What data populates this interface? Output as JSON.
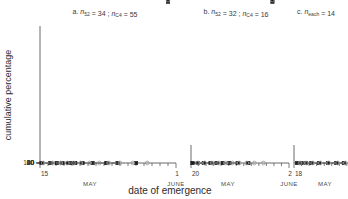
{
  "figure": {
    "ylabel": "cumulative percentage",
    "xlabel": "date of emergence"
  },
  "chart_data": {
    "type": "line",
    "title": "",
    "xlabel": "date of emergence",
    "ylabel": "cumulative percentage",
    "yscale": "probit",
    "ylim": [
      10,
      100
    ],
    "yticks": [
      10,
      20,
      40,
      60,
      80,
      100
    ],
    "ytick_labels": [
      "10",
      "20",
      "40",
      "60",
      "80",
      "100"
    ],
    "grid": false,
    "legend": "none",
    "panels": [
      {
        "key": "a",
        "label_letter": "a.",
        "label_parts": [
          {
            "text": "n",
            "italic": true
          },
          {
            "text": "52",
            "sub": true
          },
          {
            "text": " = 34 ; "
          },
          {
            "text": "n",
            "italic": true
          },
          {
            "text": "C4",
            "sub": true
          },
          {
            "text": " = 55"
          }
        ],
        "label_plain": "a.  n52 = 34 ; nC4 = 55",
        "n_52": 34,
        "n_C4": 55,
        "x_start_label": "15",
        "x_end_label": "1",
        "x_start_month": "MAY",
        "x_end_month": "JUNE",
        "x_tick_count": 17,
        "series": [
          {
            "name": "n52",
            "style": "solid",
            "marker": "filled-square",
            "x": [
              15.2,
              16.3,
              17.1,
              17.8,
              18.5,
              19.0,
              19.4,
              20.3,
              21.6,
              23.3,
              24.7,
              27.0,
              31.0
            ],
            "values": [
              10.5,
              11.5,
              13.0,
              14.5,
              17.0,
              23.0,
              69.0,
              82.5,
              90.0,
              94.0,
              96.5,
              99.0,
              101.0
            ]
          },
          {
            "name": "nC4",
            "style": "dashed",
            "marker": "open-circle",
            "x": [
              15.4,
              16.6,
              17.6,
              18.4,
              19.2,
              20.1,
              21.2,
              22.4,
              23.6,
              25.0,
              26.6,
              28.4,
              31.0
            ],
            "values": [
              10.3,
              11.0,
              12.0,
              13.5,
              16.0,
              22.0,
              35.0,
              55.0,
              74.0,
              88.0,
              95.0,
              99.0,
              101.0
            ]
          }
        ]
      },
      {
        "key": "b",
        "label_letter": "b.",
        "label_parts": [
          {
            "text": "n",
            "italic": true
          },
          {
            "text": "52",
            "sub": true
          },
          {
            "text": " = 32 ; "
          },
          {
            "text": "n",
            "italic": true
          },
          {
            "text": "C4",
            "sub": true
          },
          {
            "text": " = 16"
          }
        ],
        "label_plain": "b.  n52 = 32 ; nC4 = 16",
        "n_52": 32,
        "n_C4": 16,
        "x_start_label": "20",
        "x_end_label": "2",
        "x_start_month": "MAY",
        "x_end_month": "JUNE",
        "x_tick_count": 14,
        "series": [
          {
            "name": "n52",
            "style": "solid",
            "marker": "filled-square",
            "x": [
              20.2,
              20.9,
              21.7,
              22.6,
              23.4,
              24.2,
              25.1,
              26.2,
              27.6,
              30.8
            ],
            "values": [
              11.5,
              18.0,
              39.5,
              57.0,
              64.0,
              75.0,
              82.5,
              90.5,
              96.5,
              101.0
            ]
          },
          {
            "name": "nC4",
            "style": "dashed",
            "marker": "open-circle",
            "x": [
              20.9,
              21.8,
              22.8,
              23.7,
              24.6,
              25.5,
              26.4,
              27.4,
              28.4,
              29.6,
              30.8
            ],
            "values": [
              11.0,
              14.0,
              20.5,
              30.0,
              39.5,
              50.0,
              58.0,
              66.5,
              73.0,
              86.0,
              101.0
            ]
          }
        ]
      },
      {
        "key": "c",
        "label_letter": "c.",
        "label_parts": [
          {
            "text": "n",
            "italic": true
          },
          {
            "text": "each",
            "sub": true
          },
          {
            "text": " = 14"
          }
        ],
        "label_plain": "c.  neach = 14",
        "n_each": 14,
        "x_start_label": "18",
        "x_end_label": "",
        "x_start_month": "MAY",
        "x_end_month": "",
        "x_tick_count": 10,
        "series": [
          {
            "name": "n52",
            "style": "solid",
            "marker": "filled-square",
            "x": [
              18.4,
              19.0,
              19.6,
              20.3,
              21.3,
              22.5,
              23.6,
              24.6
            ],
            "values": [
              11.5,
              16.0,
              38.0,
              57.0,
              75.0,
              85.5,
              93.5,
              100.0
            ]
          },
          {
            "name": "nC4",
            "style": "dashed",
            "marker": "open-circle",
            "x": [
              18.8,
              19.6,
              20.5,
              21.5,
              22.6,
              23.8,
              24.8
            ],
            "values": [
              10.5,
              13.0,
              21.0,
              34.5,
              50.0,
              68.0,
              86.0
            ]
          }
        ]
      }
    ]
  }
}
